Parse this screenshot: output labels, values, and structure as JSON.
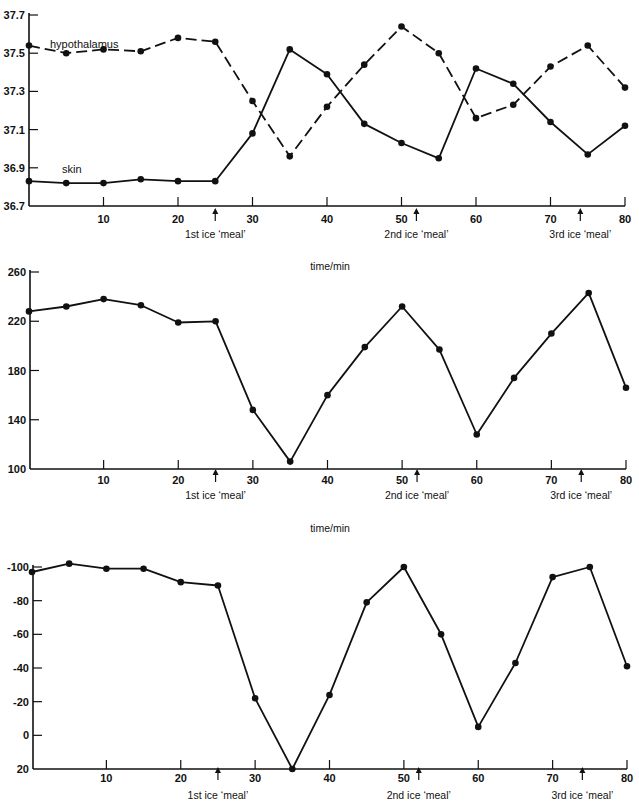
{
  "chart_data": [
    {
      "type": "line",
      "title": "",
      "xlabel": "time/min",
      "ylabel": "",
      "ylim": [
        36.7,
        37.7
      ],
      "xlim": [
        0,
        80
      ],
      "yticks": [
        "37.7",
        "37.5",
        "37.3",
        "37.1",
        "36.9",
        "36.7"
      ],
      "xticks": [
        "10",
        "20",
        "30",
        "40",
        "50",
        "60",
        "70",
        "80"
      ],
      "x": [
        0,
        5,
        10,
        15,
        20,
        25,
        30,
        35,
        40,
        45,
        50,
        55,
        60,
        65,
        70,
        75,
        80
      ],
      "series": [
        {
          "name": "hypothalamus",
          "style": "dashed",
          "values": [
            37.54,
            37.5,
            37.52,
            37.51,
            37.58,
            37.56,
            37.25,
            36.96,
            37.22,
            37.44,
            37.64,
            37.5,
            37.16,
            37.23,
            37.43,
            37.54,
            37.32
          ]
        },
        {
          "name": "skin",
          "style": "solid",
          "values": [
            36.83,
            36.82,
            36.82,
            36.84,
            36.83,
            36.83,
            37.08,
            37.52,
            37.39,
            37.13,
            37.03,
            36.95,
            37.42,
            37.34,
            37.14,
            36.97,
            37.12
          ]
        }
      ],
      "annotations": [
        {
          "x": 25,
          "text": "1st ice ‘meal’"
        },
        {
          "x": 52,
          "text": "2nd ice ‘meal’"
        },
        {
          "x": 74,
          "text": "3rd ice ‘meal’"
        }
      ],
      "grid": false,
      "legend": "inline labels"
    },
    {
      "type": "line",
      "title": "",
      "xlabel": "time/min",
      "ylabel": "",
      "ylim": [
        100,
        260
      ],
      "xlim": [
        0,
        80
      ],
      "yticks": [
        "260",
        "220",
        "180",
        "140",
        "100"
      ],
      "xticks": [
        "10",
        "20",
        "30",
        "40",
        "50",
        "60",
        "70",
        "80"
      ],
      "x": [
        0,
        5,
        10,
        15,
        20,
        25,
        30,
        35,
        40,
        45,
        50,
        55,
        60,
        65,
        70,
        75,
        80
      ],
      "series": [
        {
          "name": "series",
          "style": "solid",
          "values": [
            228,
            232,
            238,
            233,
            219,
            220,
            148,
            106,
            160,
            199,
            232,
            197,
            128,
            174,
            210,
            243,
            166
          ]
        }
      ],
      "annotations": [
        {
          "x": 25,
          "text": "1st ice ‘meal’"
        },
        {
          "x": 52,
          "text": "2nd ice ‘meal’"
        },
        {
          "x": 74,
          "text": "3rd ice ‘meal’"
        }
      ],
      "grid": false
    },
    {
      "type": "line",
      "title": "",
      "xlabel": "",
      "ylabel": "",
      "ylim": [
        -100,
        20
      ],
      "y_inverted": true,
      "xlim": [
        0,
        80
      ],
      "yticks": [
        "-100",
        "-80",
        "-60",
        "-40",
        "-20",
        "0",
        "20"
      ],
      "xticks": [
        "10",
        "20",
        "30",
        "40",
        "50",
        "60",
        "70",
        "80"
      ],
      "x": [
        0,
        5,
        10,
        15,
        20,
        25,
        30,
        35,
        40,
        45,
        50,
        55,
        60,
        65,
        70,
        75,
        80
      ],
      "series": [
        {
          "name": "series",
          "style": "solid",
          "values": [
            -97,
            -102,
            -99,
            -99,
            -91,
            -89,
            -22,
            20,
            -24,
            -79,
            -100,
            -60,
            -5,
            -43,
            -94,
            -100,
            -41
          ]
        }
      ],
      "annotations": [
        {
          "x": 25,
          "text": "1st ice ‘meal’"
        },
        {
          "x": 52,
          "text": "2nd ice ‘meal’"
        },
        {
          "x": 74,
          "text": "3rd ice ‘meal’"
        }
      ],
      "grid": false
    }
  ]
}
